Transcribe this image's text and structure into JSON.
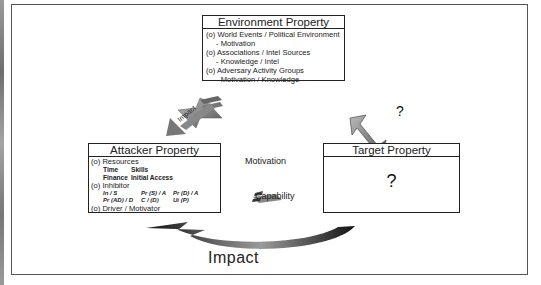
{
  "diagram": {
    "environment": {
      "title": "Environment Property",
      "lines": [
        {
          "text": "(o) World Events / Political Environment",
          "indent": false
        },
        {
          "text": "- Motivation",
          "indent": true
        },
        {
          "text": "(o) Associations / Intel Sources",
          "indent": false
        },
        {
          "text": "- Knowledge / Intel",
          "indent": true
        },
        {
          "text": "(o) Adversary Activity Groups",
          "indent": false
        },
        {
          "text": "- Motivation / Knowledge",
          "indent": true
        }
      ]
    },
    "attacker": {
      "title": "Attacker Property",
      "resources_label": "(o) Resources",
      "resources": [
        "Time",
        "Skills",
        "Finance",
        "Initial Access"
      ],
      "inhibitor_label": "(o) Inhibitor",
      "inhibitors": [
        "In / S",
        "Pr (S) / A",
        "Pr (D) / A",
        "Pr (AD) / D",
        "C / (D)",
        "Ui (P)"
      ],
      "driver_label": "(o) Driver / Motivator"
    },
    "target": {
      "title": "Target Property",
      "body": "?"
    },
    "middle": {
      "motivation": "Motivation",
      "capability": "Capability"
    },
    "arrows": {
      "env_to_attacker_label": "Impact",
      "env_target_question": "?",
      "bottom_label": "Impact"
    },
    "colors": {
      "border": "#222222",
      "arrow_dark": "#1a1a1a",
      "arrow_gray": "#8a8a8a"
    }
  }
}
